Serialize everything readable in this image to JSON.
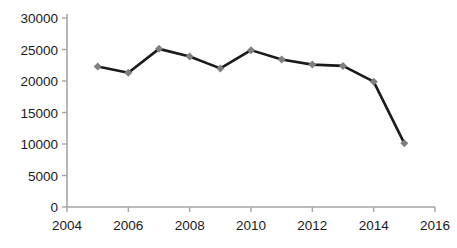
{
  "chart_data": {
    "type": "line",
    "title": "",
    "xlabel": "",
    "ylabel": "",
    "x": [
      2005,
      2006,
      2007,
      2008,
      2009,
      2010,
      2011,
      2012,
      2013,
      2014,
      2015
    ],
    "values": [
      22300,
      21300,
      25100,
      23900,
      22000,
      24900,
      23400,
      22600,
      22400,
      19900,
      10100
    ],
    "series": [
      {
        "name": "series-1",
        "values": [
          22300,
          21300,
          25100,
          23900,
          22000,
          24900,
          23400,
          22600,
          22400,
          19900,
          10100
        ]
      }
    ],
    "xlim": [
      2004,
      2016
    ],
    "ylim": [
      0,
      30000
    ],
    "xticks": [
      2004,
      2006,
      2008,
      2010,
      2012,
      2014,
      2016
    ],
    "yticks": [
      0,
      5000,
      10000,
      15000,
      20000,
      25000,
      30000
    ],
    "xtick_labels": [
      "2004",
      "2006",
      "2008",
      "2010",
      "2012",
      "2014",
      "2016"
    ],
    "ytick_labels": [
      "0",
      "5000",
      "10000",
      "15000",
      "20000",
      "25000",
      "30000"
    ],
    "grid": false,
    "legend": false,
    "legend_position": "none",
    "line_color": "#1a1a1a",
    "marker_color": "#7f7f7f",
    "marker_shape": "diamond",
    "axis_color": "#a6a6a6",
    "background_color": "#ffffff"
  }
}
